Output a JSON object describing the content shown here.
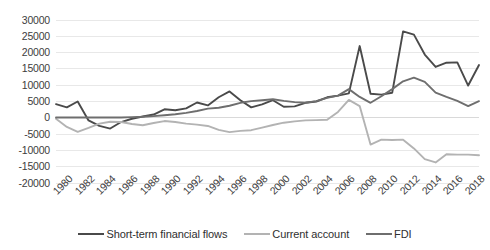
{
  "chart_data": {
    "type": "line",
    "title": "",
    "xlabel": "",
    "ylabel": "",
    "grid": true,
    "legend_position": "bottom",
    "ylim": [
      -20000,
      30000
    ],
    "ytick_step": 5000,
    "ytick_labels": [
      "30000",
      "25000",
      "20000",
      "15000",
      "10000",
      "5000",
      "0",
      "-5000",
      "-10000",
      "-15000",
      "-20000"
    ],
    "ytick_values": [
      30000,
      25000,
      20000,
      15000,
      10000,
      5000,
      0,
      -5000,
      -10000,
      -15000,
      -20000
    ],
    "x": [
      1980,
      1981,
      1982,
      1983,
      1984,
      1985,
      1986,
      1987,
      1988,
      1989,
      1990,
      1991,
      1992,
      1993,
      1994,
      1995,
      1996,
      1997,
      1998,
      1999,
      2000,
      2001,
      2002,
      2003,
      2004,
      2005,
      2006,
      2007,
      2008,
      2009,
      2010,
      2011,
      2012,
      2013,
      2014,
      2015,
      2016,
      2017,
      2018,
      2019
    ],
    "xtick_labels": [
      "1980",
      "1982",
      "1984",
      "1986",
      "1988",
      "1990",
      "1992",
      "1994",
      "1996",
      "1998",
      "2000",
      "2002",
      "2004",
      "2006",
      "2008",
      "2010",
      "2012",
      "2014",
      "2016",
      "2018"
    ],
    "xtick_values": [
      1980,
      1982,
      1984,
      1986,
      1988,
      1990,
      1992,
      1994,
      1996,
      1998,
      2000,
      2002,
      2004,
      2006,
      2008,
      2010,
      2012,
      2014,
      2016,
      2018
    ],
    "series": [
      {
        "name": "Short-term financial flows",
        "color": "#4a4a4a",
        "width": 1.9,
        "values": [
          4200,
          3200,
          5000,
          -800,
          -2500,
          -3300,
          -1300,
          -300,
          400,
          1000,
          2600,
          2300,
          2900,
          4700,
          3800,
          6300,
          8100,
          5400,
          3200,
          4100,
          5400,
          3400,
          3500,
          4600,
          5000,
          6300,
          6800,
          7500,
          22000,
          7400,
          7100,
          7700,
          26500,
          25500,
          19400,
          15600,
          16900,
          17000,
          9900,
          16200
        ]
      },
      {
        "name": "Current account",
        "color": "#b3b3b3",
        "width": 1.9,
        "values": [
          -300,
          -2800,
          -4300,
          -3100,
          -1800,
          -1200,
          -1300,
          -1900,
          -2300,
          -1600,
          -1000,
          -1300,
          -1800,
          -2100,
          -2500,
          -3700,
          -4400,
          -4000,
          -3800,
          -3000,
          -2200,
          -1500,
          -1100,
          -800,
          -700,
          -600,
          1800,
          5500,
          3600,
          -8200,
          -6700,
          -6800,
          -6700,
          -9400,
          -12700,
          -13700,
          -11200,
          -11300,
          -11300,
          -11500
        ]
      },
      {
        "name": "FDI",
        "color": "#6e6e6e",
        "width": 1.9,
        "values": [
          100,
          100,
          100,
          100,
          100,
          100,
          100,
          200,
          300,
          500,
          800,
          1100,
          1500,
          2100,
          2800,
          3100,
          3700,
          4600,
          5100,
          5400,
          5700,
          5200,
          4800,
          4600,
          5100,
          6100,
          6800,
          8800,
          6400,
          4600,
          6600,
          8800,
          11200,
          12300,
          11000,
          7700,
          6400,
          5200,
          3600,
          5100
        ]
      }
    ]
  },
  "legend": {
    "entries": [
      {
        "label": "Short-term financial flows"
      },
      {
        "label": "Current account"
      },
      {
        "label": "FDI"
      }
    ]
  }
}
